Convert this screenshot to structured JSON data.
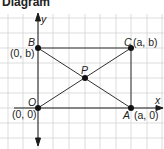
{
  "title": "Diagram",
  "axes": {
    "x_label": "x",
    "y_label": "y"
  },
  "points": {
    "O": {
      "name": "O",
      "coord": "(0, 0)"
    },
    "A": {
      "name": "A",
      "coord": "(a, 0)"
    },
    "B": {
      "name": "B",
      "coord": "(0, b)"
    },
    "C": {
      "name": "C",
      "coord": "(a, b)"
    },
    "P": {
      "name": "P"
    }
  },
  "colors": {
    "grid": "#c8c8c8",
    "ink": "#1a1a1a"
  }
}
